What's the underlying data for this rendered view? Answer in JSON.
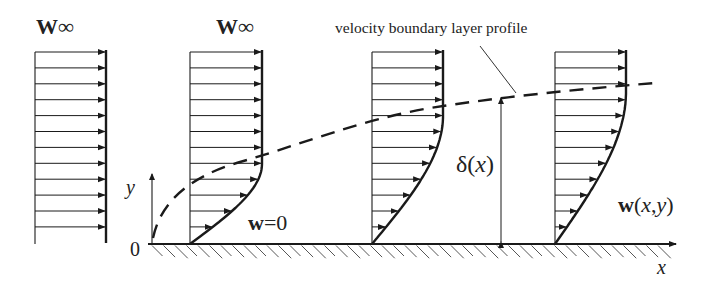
{
  "diagram": {
    "title": "velocity boundary layer profile",
    "colors": {
      "ink": "#1a1a1a",
      "background": "#ffffff"
    },
    "labels": {
      "free_stream_1": "W∞",
      "free_stream_2": "W∞",
      "boundary_layer": "velocity boundary layer profile",
      "y_axis": "y",
      "x_axis": "x",
      "origin": "0",
      "wall_condition": "w=0",
      "thickness": "δ(x)",
      "velocity_field": "w(x,y)"
    },
    "profiles": [
      {
        "name": "uniform-inlet",
        "left": 35,
        "right": 106,
        "arrows": 13
      },
      {
        "name": "profile-1",
        "left": 190,
        "right": 262,
        "arrows": 13
      },
      {
        "name": "profile-2",
        "left": 372,
        "right": 443,
        "arrows": 13
      },
      {
        "name": "profile-3",
        "left": 555,
        "right": 626,
        "arrows": 13
      }
    ],
    "wall": {
      "y": 244,
      "x_start": 148,
      "x_end": 676
    },
    "y_axis": {
      "x": 152,
      "y_top": 172,
      "y_bottom": 244
    },
    "delta_arrow": {
      "x": 501,
      "y_top": 96,
      "y_bottom": 244
    }
  }
}
